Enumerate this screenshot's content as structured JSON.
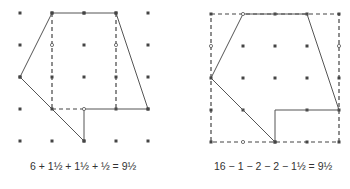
{
  "figures": [
    {
      "name": "left-figure",
      "caption": "6 + 1½ + 1½ + ½ = 9½",
      "method": "decomposition"
    },
    {
      "name": "right-figure",
      "caption": "16 − 1 − 2 − 2 − 1½ = 9½",
      "method": "subtraction-from-square"
    }
  ],
  "colors": {
    "line": "#555555",
    "dot": "#444444"
  }
}
